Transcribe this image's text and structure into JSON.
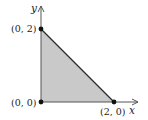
{
  "diagram": {
    "type": "region-in-plane",
    "axes": {
      "x_label": "x",
      "y_label": "y"
    },
    "vertices": [
      {
        "label": "(0, 2)",
        "x": 0,
        "y": 2
      },
      {
        "label": "(0, 0)",
        "x": 0,
        "y": 0
      },
      {
        "label": "(2, 0)",
        "x": 2,
        "y": 0
      }
    ],
    "colors": {
      "fill": "#c9c9c9",
      "stroke": "#2b2b2b",
      "axis": "#555555",
      "point": "#111111"
    }
  }
}
